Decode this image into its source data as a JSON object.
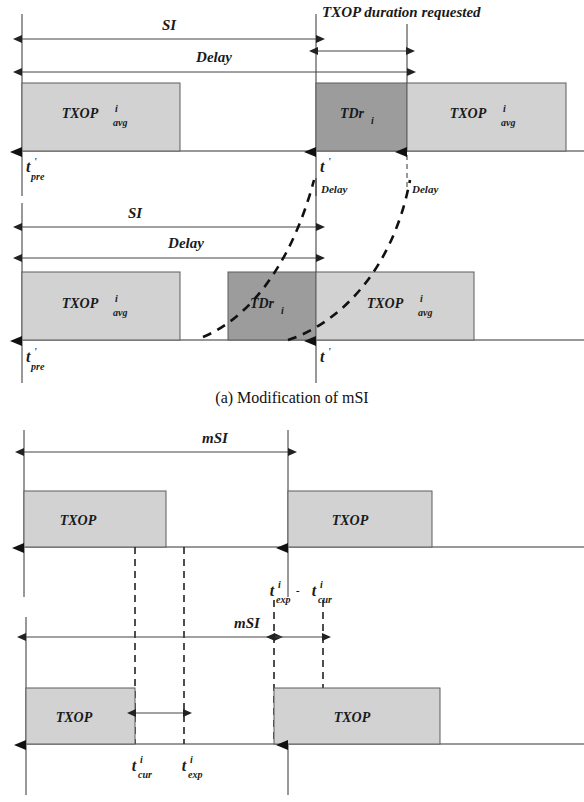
{
  "figure": {
    "colors": {
      "box_light": "#d2d2d2",
      "box_dark": "#9c9c9c",
      "line": "#333333",
      "dashed": "#222222",
      "text": "#1a1a1a"
    },
    "caption_a": "(a) Modification of mSI"
  },
  "panel_a": {
    "name": "Modification of mSI",
    "timeline_1": {
      "arrows": [
        {
          "label": "SI"
        },
        {
          "label": "Delay"
        },
        {
          "label": "TXOP duration requested"
        }
      ],
      "boxes": [
        {
          "label_main": "TXOP",
          "label_sup": "i",
          "label_sub": "avg",
          "shade": "light"
        },
        {
          "label_main": "TDr",
          "label_sup": "",
          "label_sub": "i",
          "shade": "dark"
        },
        {
          "label_main": "TXOP",
          "label_sup": "i",
          "label_sub": "avg",
          "shade": "light"
        }
      ],
      "ticks": [
        {
          "label_main": "t",
          "label_sup": "'",
          "label_sub": "pre"
        },
        {
          "label_main": "t",
          "label_sup": "'",
          "label_sub": ""
        }
      ],
      "delay_marks": [
        "Delay",
        "Delay"
      ]
    },
    "timeline_2": {
      "arrows": [
        {
          "label": "SI"
        },
        {
          "label": "Delay"
        }
      ],
      "boxes": [
        {
          "label_main": "TXOP",
          "label_sup": "i",
          "label_sub": "avg",
          "shade": "light"
        },
        {
          "label_main": "TDr",
          "label_sup": "",
          "label_sub": "i",
          "shade": "dark"
        },
        {
          "label_main": "TXOP",
          "label_sup": "i",
          "label_sub": "avg",
          "shade": "light"
        }
      ],
      "ticks": [
        {
          "label_main": "t",
          "label_sup": "'",
          "label_sub": "pre"
        },
        {
          "label_main": "t",
          "label_sup": "'",
          "label_sub": ""
        }
      ]
    }
  },
  "panel_b": {
    "timeline_1": {
      "arrows": [
        {
          "label": "mSI"
        }
      ],
      "boxes": [
        {
          "label_main": "TXOP",
          "shade": "light"
        },
        {
          "label_main": "TXOP",
          "shade": "light"
        }
      ]
    },
    "timeline_2": {
      "arrows": [
        {
          "label": "mSI"
        }
      ],
      "boxes": [
        {
          "label_main": "TXOP",
          "shade": "light"
        },
        {
          "label_main": "TXOP",
          "shade": "light"
        }
      ],
      "markers_top": [
        {
          "label_main": "t",
          "label_sup": "i",
          "label_sub": "exp",
          "trail": "-"
        },
        {
          "label_main": "t",
          "label_sup": "i",
          "label_sub": "cur",
          "trail": ""
        }
      ],
      "markers_bottom": [
        {
          "label_main": "t",
          "label_sup": "i",
          "label_sub": "cur"
        },
        {
          "label_main": "t",
          "label_sup": "i",
          "label_sub": "exp"
        }
      ]
    }
  }
}
